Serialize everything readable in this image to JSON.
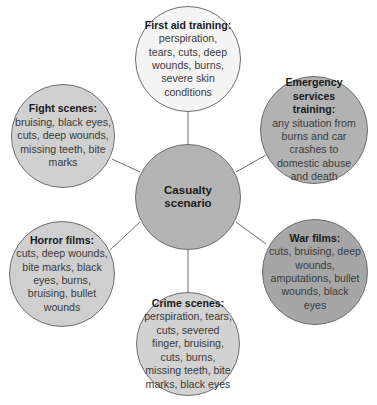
{
  "diagram": {
    "type": "mind-map",
    "center": {
      "label": "Casualty scenario",
      "color": "#b4b4b4",
      "cx": 188,
      "cy": 197,
      "r": 53
    },
    "nodes": [
      {
        "id": "first-aid",
        "title": "First aid training:",
        "body": "perspiration, tears, cuts, deep wounds, burns, severe skin conditions",
        "color": "#f4f4f4",
        "cx": 188,
        "cy": 59,
        "r": 53
      },
      {
        "id": "emergency",
        "title": "Emergency services training:",
        "body": "any situation from burns and car crashes to domestic abuse and death",
        "color": "#b2b2b2",
        "cx": 314,
        "cy": 130,
        "r": 54
      },
      {
        "id": "war",
        "title": "War films:",
        "body": "cuts, bruising, deep wounds, amputations, bullet wounds, black eyes",
        "color": "#a6a6a6",
        "cx": 315,
        "cy": 272,
        "r": 53
      },
      {
        "id": "crime",
        "title": "Crime scenes:",
        "body": "perspiration, tears, cuts, severed finger, bruising, cuts, burns, missing teeth, bite marks, black eyes",
        "color": "#d2d2d2",
        "cx": 188,
        "cy": 344,
        "r": 52
      },
      {
        "id": "horror",
        "title": "Horror films:",
        "body": "cuts, deep wounds, bite marks, black eyes, burns, bruising, bullet wounds",
        "color": "#cfcfcf",
        "cx": 62,
        "cy": 274,
        "r": 53
      },
      {
        "id": "fight",
        "title": "Fight scenes:",
        "body": "bruising, black eyes, cuts, deep wounds, missing teeth, bite marks",
        "color": "#d0d0d0",
        "cx": 63,
        "cy": 136,
        "r": 52
      }
    ],
    "connector_color": "#6e6e6e"
  }
}
